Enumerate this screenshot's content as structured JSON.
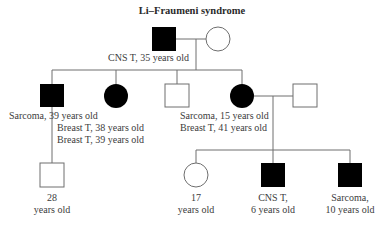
{
  "title": "Li–Fraumeni syndrome",
  "colors": {
    "affected": "#000000",
    "line": "#6e6e6e",
    "unaffected_fill": "#ffffff"
  },
  "pedigree": {
    "generation_1": {
      "father": {
        "sex": "male",
        "affected": true,
        "label": "CNS T, 35 years old"
      },
      "mother": {
        "sex": "female",
        "affected": false,
        "label": ""
      }
    },
    "generation_2": [
      {
        "sex": "male",
        "affected": true,
        "label": "Sarcoma, 39 years old"
      },
      {
        "sex": "female",
        "affected": true,
        "label_lines": [
          "Breast T, 38 years old",
          "Breast T, 39 years old"
        ]
      },
      {
        "sex": "male",
        "affected": false,
        "label": ""
      },
      {
        "sex": "female",
        "affected": true,
        "label_lines": [
          "Sarcoma, 15 years old",
          "Breast T, 41 years old"
        ]
      },
      {
        "sex": "male",
        "affected": false,
        "label": "",
        "role": "spouse"
      }
    ],
    "generation_3": [
      {
        "sex": "male",
        "affected": false,
        "parent": "gen2-male-sarcoma",
        "label_lines": [
          "28",
          "years old"
        ]
      },
      {
        "sex": "female",
        "affected": false,
        "label_lines": [
          "17",
          "years old"
        ]
      },
      {
        "sex": "male",
        "affected": true,
        "label_lines": [
          "CNS T,",
          "6 years old"
        ]
      },
      {
        "sex": "male",
        "affected": true,
        "label_lines": [
          "Sarcoma,",
          "10 years old"
        ]
      }
    ]
  }
}
